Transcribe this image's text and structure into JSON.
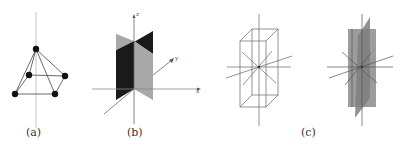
{
  "figure": {
    "panels": [
      {
        "id": "a",
        "label": "(a)",
        "description": "square pyramid with vertical axis through apex"
      },
      {
        "id": "b",
        "label": "(b)",
        "description": "two perpendicular vertical planes on 3D axes",
        "axes": {
          "z": "z",
          "y": "y",
          "x": "x"
        }
      },
      {
        "id": "c",
        "label": "(c)",
        "description": "rectangular prism with symmetry axes; prism with shaded mirror planes"
      }
    ]
  },
  "colors": {
    "line": "#555555",
    "axis": "#8a8a8a",
    "vertex": "#111111",
    "dark_plane": "#1a1a1a",
    "light_plane": "#a8a8a8",
    "shaded_plane": "#9c9c9c"
  }
}
